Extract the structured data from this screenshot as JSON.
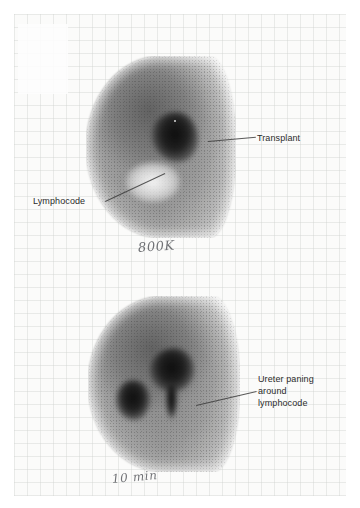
{
  "figure": {
    "kind": "nuclear-medicine-renal-scintigraphy",
    "background_color": "#ffffff",
    "sheet_color": "#fbfbfa",
    "ink_color": "#2b2b2b",
    "handwriting_color": "#53555a"
  },
  "scans": [
    {
      "id": "scan-upper",
      "handwritten_note": "800K",
      "labels": [
        {
          "id": "transplant",
          "text": "Transplant"
        },
        {
          "id": "lymphocode",
          "text": "Lymphocode"
        }
      ]
    },
    {
      "id": "scan-lower",
      "handwritten_note": "10 min",
      "labels": [
        {
          "id": "ureter",
          "line1": "Ureter paning",
          "line2": "around",
          "line3": "lymphocode"
        }
      ]
    }
  ]
}
